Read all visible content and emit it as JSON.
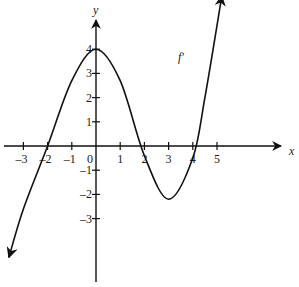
{
  "chart_data": {
    "type": "line",
    "title": "",
    "series": [
      {
        "name": "f'",
        "x": [
          -3.6,
          -3,
          -2,
          -1,
          0,
          1,
          2,
          3,
          4,
          4.5,
          5.2
        ],
        "y": [
          -4.6,
          -2.6,
          0,
          2.7,
          4,
          2.7,
          -0.4,
          -2.2,
          -0.5,
          2,
          6.2
        ]
      }
    ],
    "xlabel": "x",
    "ylabel": "y",
    "curve_label": "f'",
    "x_ticks": [
      "-3",
      "-2",
      "-1",
      "0",
      "1",
      "2",
      "3",
      "4",
      "5"
    ],
    "y_ticks": [
      "4",
      "3",
      "2",
      "1",
      "-1",
      "-2",
      "-3"
    ],
    "xlim": [
      -3.8,
      7.5
    ],
    "ylim": [
      -5.6,
      5.2
    ],
    "grid": false,
    "legend": "none",
    "zeros": [
      -2,
      1.8,
      4.2
    ],
    "local_max": {
      "x": 0,
      "y": 4
    },
    "local_min": {
      "x": 3,
      "y": -2.2
    }
  }
}
